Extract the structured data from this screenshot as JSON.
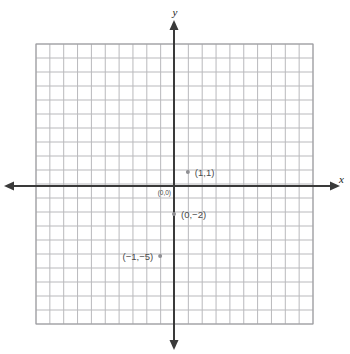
{
  "figure": {
    "kind": "coordinate-plane",
    "background_color": "#ffffff",
    "grid_line_color": "#b9b9bc",
    "grid_minor_color": "#d8d8dc",
    "grid_border_color": "#9a9a9e",
    "axis_color": "#3a3a3a",
    "point_color": "#8f8f93",
    "label_color": "#4a4a4a"
  },
  "axes": {
    "x_axis_label": "x",
    "y_axis_label": "y",
    "x_min": -10,
    "x_max": 10,
    "y_min": -10,
    "y_max": 10,
    "x_tick_step": 1,
    "y_tick_step": 1,
    "tick_labels_shown": false,
    "arrowheads": [
      "left",
      "right",
      "up",
      "down"
    ]
  },
  "chart_data": {
    "type": "scatter",
    "title": "",
    "xlabel": "x",
    "ylabel": "y",
    "xlim": [
      -10,
      10
    ],
    "ylim": [
      -10,
      10
    ],
    "grid": true,
    "legend": false,
    "points": [
      {
        "label": "(0,0)",
        "x": 0,
        "y": 0,
        "marker_drawn": false,
        "label_position": "left-below"
      },
      {
        "label": "(1,1)",
        "x": 1,
        "y": 1,
        "marker_drawn": true,
        "label_position": "right"
      },
      {
        "label": "(0,−2)",
        "x": 0,
        "y": -2,
        "marker_drawn": true,
        "label_position": "right"
      },
      {
        "label": "(−1,−5)",
        "x": -1,
        "y": -5,
        "marker_drawn": true,
        "label_position": "left"
      }
    ]
  }
}
